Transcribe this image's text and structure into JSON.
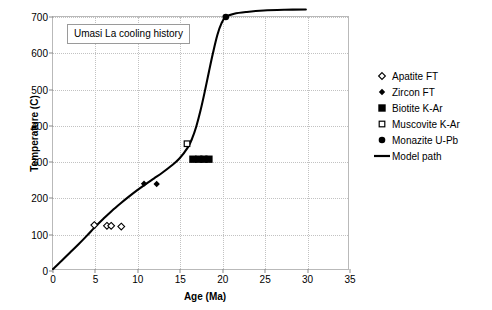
{
  "chart_data": {
    "type": "scatter",
    "title": "Umasi La cooling history",
    "xlabel": "Age (Ma)",
    "ylabel": "Temperature (C)",
    "xlim": [
      0,
      35
    ],
    "ylim": [
      0,
      700
    ],
    "xticks": [
      0,
      5,
      10,
      15,
      20,
      25,
      30,
      35
    ],
    "yticks": [
      0,
      100,
      200,
      300,
      400,
      500,
      600,
      700
    ],
    "grid": true,
    "legend_position": "right",
    "series": [
      {
        "name": "Apatite FT",
        "marker": "open-diamond",
        "color": "#000000",
        "points": [
          {
            "x": 4.9,
            "y": 122
          },
          {
            "x": 6.4,
            "y": 120
          },
          {
            "x": 6.9,
            "y": 120
          },
          {
            "x": 8.1,
            "y": 118
          }
        ]
      },
      {
        "name": "Zircon FT",
        "marker": "filled-diamond",
        "color": "#000000",
        "points": [
          {
            "x": 10.8,
            "y": 237
          },
          {
            "x": 12.3,
            "y": 236
          }
        ]
      },
      {
        "name": "Biotite K-Ar",
        "marker": "filled-square",
        "color": "#000000",
        "points": [
          {
            "x": 16.6,
            "y": 305
          },
          {
            "x": 17.3,
            "y": 305
          },
          {
            "x": 17.9,
            "y": 305
          },
          {
            "x": 18.5,
            "y": 305
          }
        ]
      },
      {
        "name": "Muscovite K-Ar",
        "marker": "open-square",
        "color": "#000000",
        "points": [
          {
            "x": 15.9,
            "y": 348
          }
        ]
      },
      {
        "name": "Monazite U-Pb",
        "marker": "filled-circle",
        "color": "#000000",
        "points": [
          {
            "x": 20.5,
            "y": 700
          }
        ]
      },
      {
        "name": "Model path",
        "marker": "line",
        "color": "#000000",
        "points": [
          {
            "x": 0.0,
            "y": 0
          },
          {
            "x": 1.0,
            "y": 22
          },
          {
            "x": 2.0,
            "y": 45
          },
          {
            "x": 3.0,
            "y": 68
          },
          {
            "x": 4.0,
            "y": 92
          },
          {
            "x": 5.0,
            "y": 117
          },
          {
            "x": 6.0,
            "y": 140
          },
          {
            "x": 7.0,
            "y": 162
          },
          {
            "x": 8.0,
            "y": 182
          },
          {
            "x": 9.0,
            "y": 201
          },
          {
            "x": 10.0,
            "y": 219
          },
          {
            "x": 11.0,
            "y": 236
          },
          {
            "x": 12.0,
            "y": 252
          },
          {
            "x": 13.0,
            "y": 268
          },
          {
            "x": 14.0,
            "y": 286
          },
          {
            "x": 15.0,
            "y": 307
          },
          {
            "x": 16.0,
            "y": 338
          },
          {
            "x": 16.5,
            "y": 362
          },
          {
            "x": 17.0,
            "y": 396
          },
          {
            "x": 17.5,
            "y": 440
          },
          {
            "x": 18.0,
            "y": 492
          },
          {
            "x": 18.5,
            "y": 548
          },
          {
            "x": 19.0,
            "y": 602
          },
          {
            "x": 19.5,
            "y": 650
          },
          {
            "x": 20.0,
            "y": 683
          },
          {
            "x": 20.5,
            "y": 700
          },
          {
            "x": 21.5,
            "y": 709
          },
          {
            "x": 23.0,
            "y": 714
          },
          {
            "x": 25.0,
            "y": 718
          },
          {
            "x": 27.5,
            "y": 720
          },
          {
            "x": 30.0,
            "y": 721
          }
        ]
      }
    ]
  },
  "legend": {
    "items": [
      {
        "label": "Apatite FT",
        "marker": "open-diamond"
      },
      {
        "label": "Zircon FT",
        "marker": "filled-diamond"
      },
      {
        "label": "Biotite K-Ar",
        "marker": "filled-square"
      },
      {
        "label": "Muscovite K-Ar",
        "marker": "open-square"
      },
      {
        "label": "Monazite U-Pb",
        "marker": "filled-circle"
      },
      {
        "label": "Model path",
        "marker": "line"
      }
    ]
  }
}
